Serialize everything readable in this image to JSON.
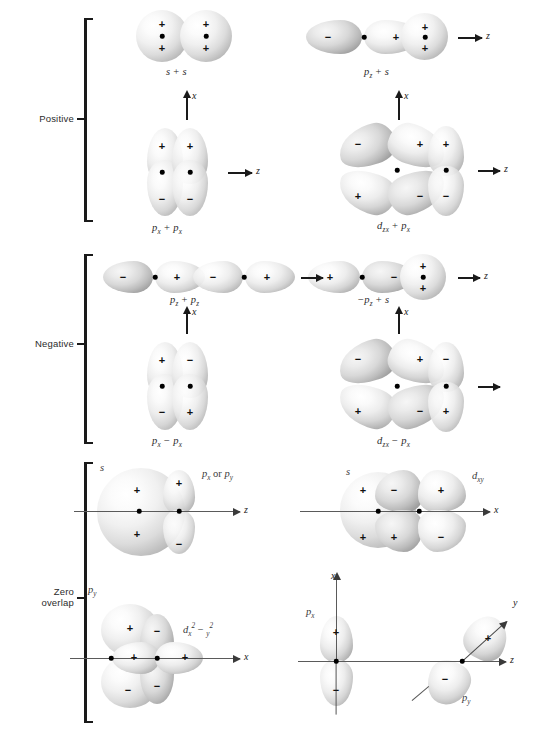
{
  "figure": {
    "sections": [
      {
        "id": "positive",
        "label": "Positive"
      },
      {
        "id": "negative",
        "label": "Negative"
      },
      {
        "id": "zero",
        "label_line1": "Zero",
        "label_line2": "overlap"
      }
    ]
  },
  "signs": {
    "plus": "+",
    "minus": "−"
  },
  "axes": {
    "x": "x",
    "y": "y",
    "z": "z"
  },
  "panels": [
    {
      "id": "s-plus-s",
      "caption_parts": {
        "left": "s",
        "op": "+",
        "right": "s"
      },
      "caption_plain": "s + s",
      "section": "positive",
      "axis_labels": []
    },
    {
      "id": "pz-plus-s",
      "caption_parts": {
        "left": "p",
        "left_sub": "z",
        "op": "+",
        "right": "s"
      },
      "caption_plain": "pz + s",
      "section": "positive",
      "axis_labels": [
        "z"
      ]
    },
    {
      "id": "px-plus-px",
      "caption_parts": {
        "left": "p",
        "left_sub": "x",
        "op": "+",
        "right": "p",
        "right_sub": "x"
      },
      "caption_plain": "px + px",
      "section": "positive",
      "axis_labels": [
        "x",
        "z"
      ]
    },
    {
      "id": "dzx-plus-px",
      "caption_parts": {
        "left": "d",
        "left_sub": "zx",
        "op": "+",
        "right": "p",
        "right_sub": "x"
      },
      "caption_plain": "dzx + px",
      "section": "positive",
      "axis_labels": [
        "x",
        "z"
      ]
    },
    {
      "id": "pz-plus-pz",
      "caption_parts": {
        "left": "p",
        "left_sub": "z",
        "op": "+",
        "right": "p",
        "right_sub": "z"
      },
      "caption_plain": "pz + pz",
      "section": "negative",
      "axis_labels": [
        "z"
      ]
    },
    {
      "id": "minus-pz-plus-s",
      "caption_parts": {
        "lead": "−",
        "left": "p",
        "left_sub": "z",
        "op": "+",
        "right": "s"
      },
      "caption_plain": "−pz + s",
      "section": "negative",
      "axis_labels": [
        "z"
      ]
    },
    {
      "id": "px-minus-px",
      "caption_parts": {
        "left": "p",
        "left_sub": "x",
        "op": "−",
        "right": "p",
        "right_sub": "x"
      },
      "caption_plain": "px − px",
      "section": "negative",
      "axis_labels": [
        "x"
      ]
    },
    {
      "id": "dzx-minus-px",
      "caption_parts": {
        "left": "d",
        "left_sub": "zx",
        "op": "−",
        "right": "p",
        "right_sub": "x"
      },
      "caption_plain": "dzx − px",
      "section": "negative",
      "axis_labels": [
        "x"
      ]
    },
    {
      "id": "s-with-px-or-py",
      "labels": {
        "left": "s",
        "right_p": "p",
        "right_sub1": "x",
        "right_or": "or",
        "right_p2": "p",
        "right_sub2": "y"
      },
      "caption_plain": "s / px or py",
      "section": "zero",
      "axis_labels": [
        "z"
      ]
    },
    {
      "id": "s-with-dxy",
      "labels": {
        "left": "s",
        "right": "d",
        "right_sub": "xy"
      },
      "caption_plain": "s / dxy",
      "section": "zero",
      "axis_labels": [
        "x"
      ]
    },
    {
      "id": "py-with-dx2y2",
      "labels": {
        "left": "p",
        "left_sub": "y",
        "right": "d",
        "right_sub": "x",
        "right_sup": "2",
        "right_op": "−",
        "right_sub2": "y",
        "right_sup2": "2"
      },
      "caption_plain": "py / dx2 − y2",
      "section": "zero",
      "axis_labels": [
        "x"
      ]
    },
    {
      "id": "px-with-py-3d",
      "labels": {
        "left": "p",
        "left_sub": "x",
        "right": "p",
        "right_sub": "y"
      },
      "caption_plain": "px / py",
      "section": "zero",
      "axis_labels": [
        "x",
        "y",
        "z"
      ]
    }
  ],
  "colors": {
    "ink": "#1a1a1a",
    "label": "#2b2b2b",
    "axis": "#5a5a5a",
    "orbital_light": "#ffffff",
    "orbital_mid": "#c8c8c8",
    "orbital_dark": "#888888",
    "background": "#ffffff"
  }
}
